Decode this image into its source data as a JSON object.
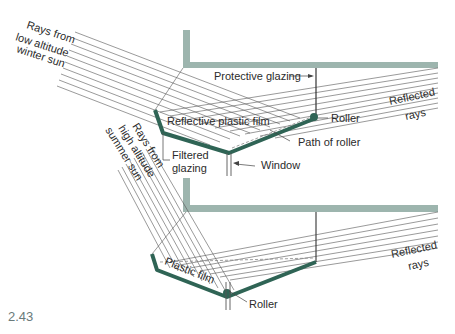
{
  "figure": {
    "number": "2.43",
    "colors": {
      "reflector": "#2f6455",
      "structure": "#9db5ae",
      "rays": "#555555",
      "text": "#2b2b2b"
    }
  },
  "top_diagram": {
    "incoming_rays_label": [
      "Rays from",
      "low altitude",
      "winter sun"
    ],
    "labels": {
      "protective_glazing": "Protective glazing",
      "reflective_film": "Reflective plastic film",
      "roller": "Roller",
      "path_of_roller": "Path of roller",
      "filtered_glazing": [
        "Filtered",
        "glazing"
      ],
      "window": "Window",
      "reflected_rays": [
        "Reflected",
        "rays"
      ]
    }
  },
  "bottom_diagram": {
    "incoming_rays_label": [
      "Rays from",
      "high altitude",
      "summer sun"
    ],
    "labels": {
      "plastic_film": "Plastic film",
      "roller": "Roller",
      "reflected_rays": [
        "Reflected",
        "rays"
      ]
    }
  }
}
